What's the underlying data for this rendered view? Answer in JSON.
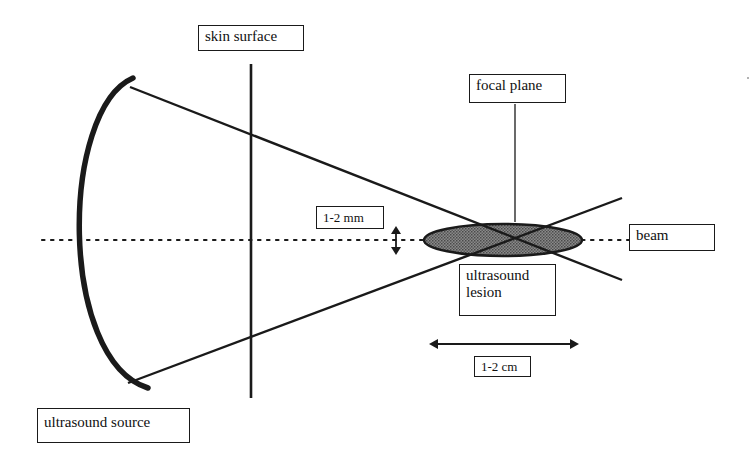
{
  "diagram": {
    "colors": {
      "line": "#1a1a1a",
      "lesion_fill": "#6e6e6e",
      "background": "#ffffff"
    },
    "labels": {
      "skin_surface": "skin surface",
      "focal_plane": "focal plane",
      "lesion_width": "1-2 mm",
      "beam": "beam",
      "ultrasound_lesion_line1": "ultrasound",
      "ultrasound_lesion_line2": "lesion",
      "lesion_length": "1-2 cm",
      "ultrasound_source": "ultrasound source"
    }
  }
}
